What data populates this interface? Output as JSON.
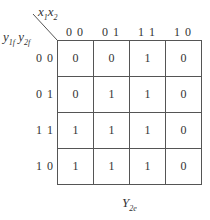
{
  "kmap": {
    "column_variables": "x1x2",
    "column_variable_parts": [
      {
        "base": "x",
        "sub": "1"
      },
      {
        "base": "x",
        "sub": "2"
      }
    ],
    "row_variable_parts": [
      {
        "base": "y",
        "sub": "1f"
      },
      {
        "base": "y",
        "sub": "2f"
      }
    ],
    "column_headers": [
      "0 0",
      "0 1",
      "1 1",
      "1 0"
    ],
    "row_headers": [
      "0 0",
      "0 1",
      "1 1",
      "1 0"
    ],
    "cells": [
      [
        "0",
        "0",
        "1",
        "0"
      ],
      [
        "0",
        "1",
        "1",
        "0"
      ],
      [
        "1",
        "1",
        "1",
        "0"
      ],
      [
        "1",
        "1",
        "1",
        "0"
      ]
    ],
    "output_label": {
      "base": "Y",
      "sub": "2e"
    }
  }
}
